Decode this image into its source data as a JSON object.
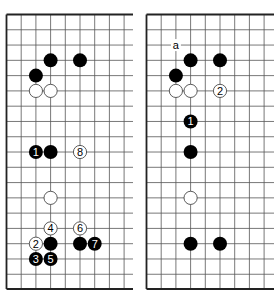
{
  "diagrams": [
    {
      "id": "left-board",
      "columns_visible": 9,
      "rows_visible": 18,
      "edges": [
        "top",
        "left",
        "bottom"
      ],
      "stones": [
        {
          "color": "black",
          "col": 3,
          "row": 3,
          "label": ""
        },
        {
          "color": "black",
          "col": 5,
          "row": 3,
          "label": ""
        },
        {
          "color": "black",
          "col": 2,
          "row": 4,
          "label": ""
        },
        {
          "color": "white",
          "col": 2,
          "row": 5,
          "label": ""
        },
        {
          "color": "white",
          "col": 3,
          "row": 5,
          "label": ""
        },
        {
          "color": "black",
          "col": 2,
          "row": 9,
          "label": "1"
        },
        {
          "color": "black",
          "col": 3,
          "row": 9,
          "label": ""
        },
        {
          "color": "white",
          "col": 5,
          "row": 9,
          "label": "8"
        },
        {
          "color": "white",
          "col": 3,
          "row": 12,
          "label": ""
        },
        {
          "color": "white",
          "col": 3,
          "row": 14,
          "label": "4"
        },
        {
          "color": "white",
          "col": 5,
          "row": 14,
          "label": "6"
        },
        {
          "color": "white",
          "col": 2,
          "row": 15,
          "label": "2"
        },
        {
          "color": "black",
          "col": 3,
          "row": 15,
          "label": ""
        },
        {
          "color": "black",
          "col": 5,
          "row": 15,
          "label": ""
        },
        {
          "color": "black",
          "col": 6,
          "row": 15,
          "label": "7"
        },
        {
          "color": "black",
          "col": 2,
          "row": 16,
          "label": "3"
        },
        {
          "color": "black",
          "col": 3,
          "row": 16,
          "label": "5"
        }
      ],
      "markers": []
    },
    {
      "id": "right-board",
      "columns_visible": 9,
      "rows_visible": 18,
      "edges": [
        "top",
        "left",
        "bottom"
      ],
      "stones": [
        {
          "color": "black",
          "col": 3,
          "row": 3,
          "label": ""
        },
        {
          "color": "black",
          "col": 5,
          "row": 3,
          "label": ""
        },
        {
          "color": "black",
          "col": 2,
          "row": 4,
          "label": ""
        },
        {
          "color": "white",
          "col": 2,
          "row": 5,
          "label": ""
        },
        {
          "color": "white",
          "col": 3,
          "row": 5,
          "label": ""
        },
        {
          "color": "white",
          "col": 5,
          "row": 5,
          "label": "2"
        },
        {
          "color": "black",
          "col": 3,
          "row": 7,
          "label": "1"
        },
        {
          "color": "black",
          "col": 3,
          "row": 9,
          "label": ""
        },
        {
          "color": "white",
          "col": 3,
          "row": 12,
          "label": ""
        },
        {
          "color": "black",
          "col": 3,
          "row": 15,
          "label": ""
        },
        {
          "color": "black",
          "col": 5,
          "row": 15,
          "label": ""
        }
      ],
      "markers": [
        {
          "col": 2,
          "row": 2,
          "label": "a"
        }
      ]
    }
  ],
  "colors": {
    "grid": "#555555",
    "edge": "#222222",
    "black_stone": "#000000",
    "white_stone": "#ffffff",
    "white_outline": "#333333"
  }
}
